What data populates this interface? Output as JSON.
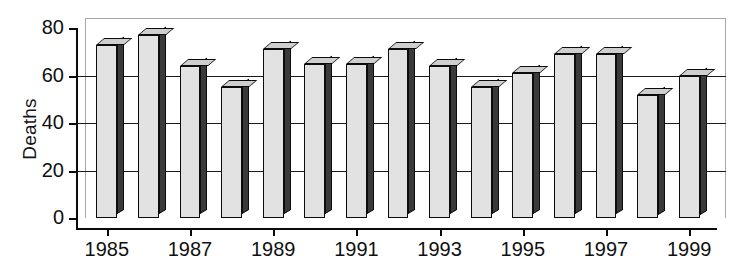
{
  "chart_data": {
    "type": "bar",
    "title": "",
    "xlabel": "",
    "ylabel": "Deaths",
    "categories": [
      "1985",
      "1986",
      "1987",
      "1988",
      "1989",
      "1990",
      "1991",
      "1992",
      "1993",
      "1994",
      "1995",
      "1996",
      "1997",
      "1998",
      "1999"
    ],
    "values": [
      73,
      77,
      64,
      55,
      71,
      65,
      65,
      71,
      64,
      55,
      61,
      69,
      69,
      52,
      60
    ],
    "ylim": [
      0,
      80
    ],
    "yticks": [
      0,
      20,
      40,
      60,
      80
    ],
    "ytick_labels": [
      "0",
      "20",
      "40",
      "60",
      "80"
    ],
    "xtick_labels": [
      "1985",
      "1987",
      "1989",
      "1991",
      "1993",
      "1995",
      "1997",
      "1999"
    ],
    "xticks_at_categories": [
      "1985",
      "1987",
      "1989",
      "1991",
      "1993",
      "1995",
      "1997",
      "1999"
    ],
    "grid": true,
    "grid_axis": "y",
    "legend": null,
    "legend_position": "none",
    "style": "3d-bar",
    "colors": {
      "bar_face": "#e2e2e2",
      "bar_side": "#3a3a3a",
      "bar_top": "#cfcfcf",
      "bar_outline": "#0c0c0c",
      "axis": "#0a0a0a",
      "grid": "#1a1a1a",
      "back_panel_border": "#a8a8a8",
      "background": "#ffffff",
      "text": "#101010"
    }
  }
}
